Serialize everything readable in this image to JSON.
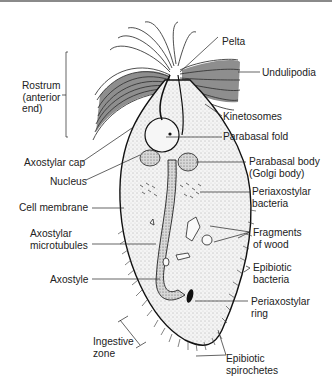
{
  "figure": {
    "labels_left": [
      {
        "id": "rostrum",
        "lines": [
          "Rostrum",
          "(anterior",
          "end)"
        ]
      },
      {
        "id": "axostylar_cap",
        "lines": [
          "Axostylar cap"
        ]
      },
      {
        "id": "nucleus",
        "lines": [
          "Nucleus"
        ]
      },
      {
        "id": "cell_membrane",
        "lines": [
          "Cell membrane"
        ]
      },
      {
        "id": "axostylar_microtubules",
        "lines": [
          "Axostylar",
          "microtubules"
        ]
      },
      {
        "id": "axostyle",
        "lines": [
          "Axostyle"
        ]
      },
      {
        "id": "ingestive_zone",
        "lines": [
          "Ingestive",
          "zone"
        ]
      }
    ],
    "labels_right": [
      {
        "id": "pelta",
        "lines": [
          "Pelta"
        ]
      },
      {
        "id": "undulipodia",
        "lines": [
          "Undulipodia"
        ]
      },
      {
        "id": "kinetosomes",
        "lines": [
          "Kinetosomes"
        ]
      },
      {
        "id": "parabasal_fold",
        "lines": [
          "Parabasal fold"
        ]
      },
      {
        "id": "parabasal_body",
        "lines": [
          "Parabasal body",
          "(Golgi body)"
        ]
      },
      {
        "id": "periaxostylar_bacteria",
        "lines": [
          "Periaxostylar",
          "bacteria"
        ]
      },
      {
        "id": "fragments_of_wood",
        "lines": [
          "Fragments",
          "of wood"
        ]
      },
      {
        "id": "epibiotic_bacteria",
        "lines": [
          "Epibiotic",
          "bacteria"
        ]
      },
      {
        "id": "periaxostylar_ring",
        "lines": [
          "Periaxostylar",
          "ring"
        ]
      },
      {
        "id": "epibiotic_spirochetes",
        "lines": [
          "Epibiotic",
          "spirochetes"
        ]
      }
    ]
  }
}
